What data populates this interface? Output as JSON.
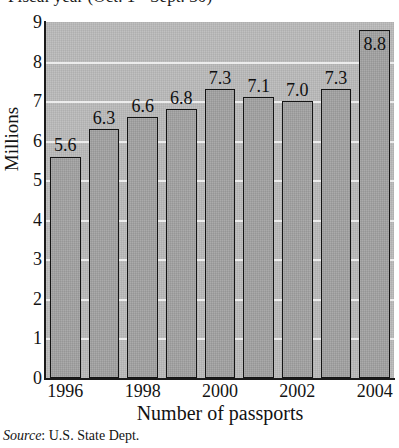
{
  "chart_data": {
    "type": "bar",
    "title": "Fiscal year (Oct. 1 - Sept. 30)",
    "xlabel": "Number of passports",
    "ylabel": "Millions",
    "ylim": [
      0,
      9
    ],
    "yticks": [
      "9",
      "8",
      "7",
      "6",
      "5",
      "4",
      "3",
      "2",
      "1",
      "0"
    ],
    "grid": true,
    "legend": "none",
    "categories": [
      "1996",
      "1997",
      "1998",
      "1999",
      "2000",
      "2001",
      "2002",
      "2003",
      "2004"
    ],
    "xtick_labels": [
      "1996",
      "1998",
      "2000",
      "2002",
      "2004"
    ],
    "values": [
      5.6,
      6.3,
      6.6,
      6.8,
      7.3,
      7.1,
      7.0,
      7.3,
      8.8
    ],
    "value_labels": [
      "5.6",
      "6.3",
      "6.6",
      "6.8",
      "7.3",
      "7.1",
      "7.0",
      "7.3",
      "8.8"
    ],
    "source_prefix": "Source",
    "source_sep": ": ",
    "source_text": "U.S. State Dept."
  },
  "colors": {
    "plot_background": "#b9b9b9",
    "bar_fill": "#a2a2a2",
    "bar_border": "#141414",
    "gridline": "#f2f2f2",
    "axis": "#1b1b1b",
    "text": "#131313",
    "page_background": "#ffffff"
  }
}
